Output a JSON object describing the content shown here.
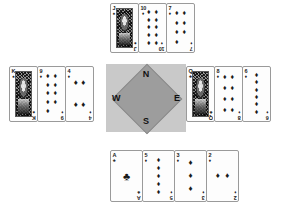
{
  "app": {
    "title": "Bridge Hand Diagram",
    "background_color": "#ffffff"
  },
  "compass": {
    "name": "compass-rose",
    "background_color": "#c9c9c9",
    "rose_color": "#9d9d9d",
    "north": "N",
    "south": "S",
    "east": "E",
    "west": "W"
  },
  "suits": {
    "spade": "♠",
    "heart": "♥",
    "diamond": "♦",
    "club": "♣"
  },
  "hands": {
    "north": {
      "label": "North",
      "cards": [
        {
          "rank": "J",
          "suit": "♠",
          "suit_name": "spade",
          "face": true,
          "pip_count": 0
        },
        {
          "rank": "10",
          "suit": "♦",
          "suit_name": "diamond",
          "face": false,
          "pip_count": 10
        },
        {
          "rank": "7",
          "suit": "♦",
          "suit_name": "diamond",
          "face": false,
          "pip_count": 7
        }
      ]
    },
    "west": {
      "label": "West",
      "cards": [
        {
          "rank": "K",
          "suit": "♠",
          "suit_name": "spade",
          "face": true,
          "pip_count": 0
        },
        {
          "rank": "9",
          "suit": "♦",
          "suit_name": "diamond",
          "face": false,
          "pip_count": 9
        },
        {
          "rank": "4",
          "suit": "♦",
          "suit_name": "diamond",
          "face": false,
          "pip_count": 4
        }
      ]
    },
    "east": {
      "label": "East",
      "cards": [
        {
          "rank": "Q",
          "suit": "♣",
          "suit_name": "club",
          "face": true,
          "pip_count": 0
        },
        {
          "rank": "8",
          "suit": "♦",
          "suit_name": "diamond",
          "face": false,
          "pip_count": 8
        },
        {
          "rank": "6",
          "suit": "♦",
          "suit_name": "diamond",
          "face": false,
          "pip_count": 6
        }
      ]
    },
    "south": {
      "label": "South",
      "cards": [
        {
          "rank": "A",
          "suit": "♣",
          "suit_name": "club",
          "face": false,
          "pip_count": 1
        },
        {
          "rank": "5",
          "suit": "♦",
          "suit_name": "diamond",
          "face": false,
          "pip_count": 5
        },
        {
          "rank": "3",
          "suit": "♦",
          "suit_name": "diamond",
          "face": false,
          "pip_count": 3
        },
        {
          "rank": "2",
          "suit": "♦",
          "suit_name": "diamond",
          "face": false,
          "pip_count": 2
        }
      ]
    }
  }
}
